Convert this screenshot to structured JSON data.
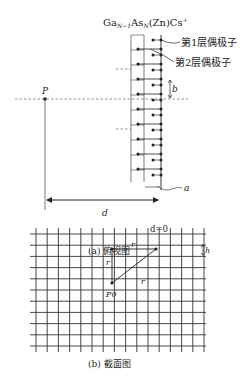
{
  "top_view": {
    "material_label": "Ga",
    "material_sub1": "N−1",
    "material_mid": "As",
    "material_sub2": "N",
    "material_tail": "(Zn)Cs",
    "material_sup": "+",
    "layer1_label": "第1层偶极子",
    "layer2_label": "第2层偶极子",
    "point_label": "P",
    "spacing_label": "b",
    "distance_label": "d",
    "origin_label": "d=0",
    "offset_label": "a",
    "caption": "(a) 俯视图",
    "dipole_rows": 10
  },
  "cross_section": {
    "point_label": "P0",
    "r_top": "r",
    "r_left": "r",
    "r_diag": "r",
    "h_label": "h",
    "caption": "(b) 截面图",
    "grid_columns": 16,
    "grid_rows": 11
  },
  "colors": {
    "ink": "#222222",
    "dash": "#555555"
  }
}
